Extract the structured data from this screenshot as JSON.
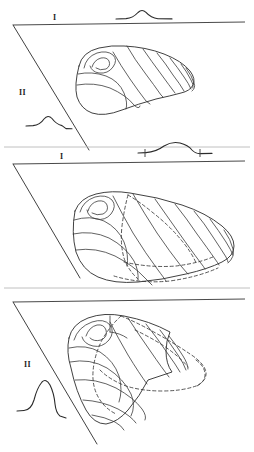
{
  "figure": {
    "background_color": "#ffffff",
    "ink_color": "#2b2b2b",
    "dashed_color": "#3a3a3a",
    "width": 254,
    "height": 452,
    "panel_count": 3
  },
  "panels": [
    {
      "id": "panel-1",
      "numeral_label": "I",
      "secondary_numeral_label": "II",
      "numeral_position": {
        "x": 56,
        "y": 17
      },
      "secondary_numeral_position": {
        "x": 22,
        "y": 92
      },
      "reference_line": {
        "x1": 13,
        "y1": 25,
        "x2": 245,
        "y2": 22
      },
      "oblique_line": {
        "x1": 13,
        "y1": 25,
        "x2": 88,
        "y2": 148
      },
      "profile_curves": [
        {
          "name": "top-profile-low-bump",
          "baseline_y": 17,
          "peak_height": 8,
          "peak_x": 142,
          "x_start": 116,
          "x_end": 172
        },
        {
          "name": "left-profile-low-bump",
          "baseline_y": 124,
          "peak_height": 9,
          "peak_x": 48,
          "x_start": 26,
          "x_end": 72
        }
      ],
      "shell": {
        "name": "bivalve-shell-stage-1",
        "growth_line_count": 9,
        "has_hidden_dashed_outline": false,
        "umbo_side": "left"
      }
    },
    {
      "id": "panel-2",
      "numeral_label": "I",
      "secondary_numeral_label": "",
      "numeral_position": {
        "x": 62,
        "y": 156
      },
      "reference_line": {
        "x1": 13,
        "y1": 164,
        "x2": 245,
        "y2": 161
      },
      "oblique_line": {
        "x1": 13,
        "y1": 164,
        "x2": 79,
        "y2": 277
      },
      "profile_curves": [
        {
          "name": "top-profile-broad-bump-with-ticks",
          "baseline_y": 151,
          "peak_height": 9,
          "peak_x": 176,
          "x_start": 138,
          "x_end": 212,
          "tick_left_x": 144,
          "tick_right_x": 200
        }
      ],
      "shell": {
        "name": "bivalve-shell-stage-2",
        "growth_line_count": 10,
        "has_hidden_dashed_outline": true,
        "umbo_side": "left"
      }
    },
    {
      "id": "panel-3",
      "numeral_label": "",
      "secondary_numeral_label": "II",
      "secondary_numeral_position": {
        "x": 27,
        "y": 364
      },
      "reference_line": {
        "x1": 13,
        "y1": 302,
        "x2": 245,
        "y2": 299
      },
      "oblique_line": {
        "x1": 13,
        "y1": 302,
        "x2": 96,
        "y2": 442
      },
      "profile_curves": [
        {
          "name": "left-profile-tall-peak",
          "baseline_y": 408,
          "peak_height": 26,
          "peak_x": 44,
          "x_start": 17,
          "x_end": 66
        }
      ],
      "shell": {
        "name": "bivalve-shell-stage-3",
        "growth_line_count": 10,
        "has_hidden_dashed_outline": true,
        "umbo_side": "left"
      }
    }
  ],
  "dividers": [
    {
      "name": "divider-1-2",
      "y": 147
    },
    {
      "name": "divider-2-3",
      "y": 288
    }
  ]
}
